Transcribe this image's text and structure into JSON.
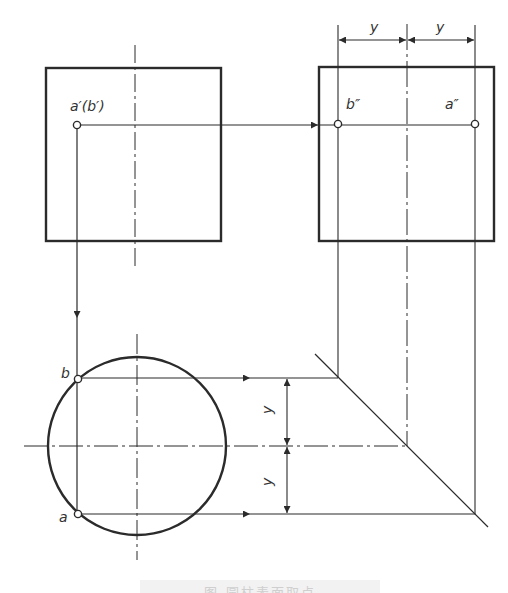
{
  "figure": {
    "caption_partial": "图 圆柱表面取点",
    "line_color": "#2b2b2b",
    "background": "#ffffff"
  },
  "labels": {
    "front_point": "a′(b′)",
    "side_point_b": "b″",
    "side_point_a": "a″",
    "top_point_b": "b",
    "top_point_a": "a",
    "dim_top_left": "y",
    "dim_top_right": "y",
    "dim_vert_upper": "y",
    "dim_vert_lower": "y"
  },
  "views": {
    "front_view": {
      "x": 46,
      "y": 68,
      "w": 175,
      "h": 173,
      "center_x": 135
    },
    "side_view": {
      "x": 319,
      "y": 67,
      "w": 175,
      "h": 174,
      "center_x": 407
    },
    "top_view": {
      "cx": 137,
      "cy": 446,
      "r": 89
    }
  },
  "points": {
    "a_prime_b_prime": {
      "x": 77,
      "y": 125
    },
    "b_double_prime": {
      "x": 338,
      "y": 124
    },
    "a_double_prime": {
      "x": 475,
      "y": 124
    },
    "b": {
      "x": 78,
      "y": 379
    },
    "a": {
      "x": 78,
      "y": 514
    }
  },
  "miter_line": {
    "x1": 315,
    "y1": 354,
    "x2": 488,
    "y2": 527
  }
}
